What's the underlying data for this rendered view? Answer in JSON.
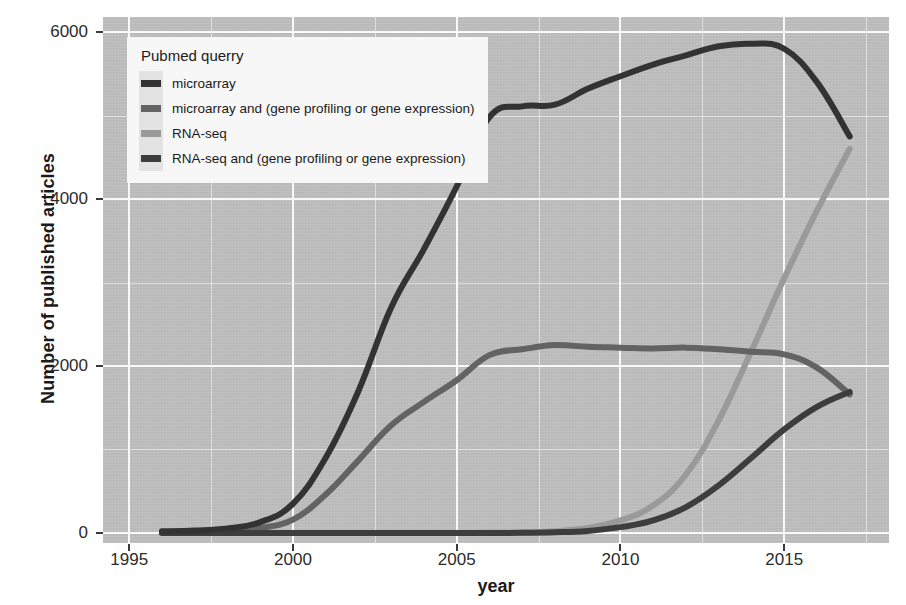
{
  "chart_data": {
    "type": "line",
    "title": "",
    "xlabel": "year",
    "ylabel": "Number of published articles",
    "xlim": [
      1994.2,
      2018.2
    ],
    "ylim": [
      -120,
      6180
    ],
    "grid": true,
    "legend_position": "top-left-inside",
    "legend_title": "Pubmed querry",
    "x_ticks": [
      1995,
      2000,
      2005,
      2010,
      2015
    ],
    "x_tick_labels": [
      "1995",
      "2000",
      "2005",
      "2010",
      "2015"
    ],
    "y_ticks": [
      0,
      2000,
      4000,
      6000
    ],
    "y_tick_labels": [
      "0",
      "2000",
      "4000",
      "6000"
    ],
    "x_minor_ticks": [
      1997.5,
      2002.5,
      2007.5,
      2012.5,
      2017.5
    ],
    "y_minor_ticks": [
      1000,
      3000,
      5000
    ],
    "x": [
      1996,
      1997,
      1998,
      1999,
      2000,
      2001,
      2002,
      2003,
      2004,
      2005,
      2006,
      2007,
      2008,
      2009,
      2010,
      2011,
      2012,
      2013,
      2014,
      2015,
      2016,
      2017
    ],
    "series": [
      {
        "name": "microarray",
        "color": "#333333",
        "values": [
          20,
          30,
          55,
          130,
          350,
          900,
          1700,
          2700,
          3400,
          4150,
          4980,
          5110,
          5130,
          5320,
          5470,
          5610,
          5720,
          5830,
          5860,
          5800,
          5400,
          4750
        ]
      },
      {
        "name": "microarray and (gene profiling or gene expression)",
        "color": "#636363",
        "values": [
          10,
          15,
          25,
          60,
          160,
          460,
          870,
          1290,
          1570,
          1830,
          2130,
          2200,
          2250,
          2230,
          2220,
          2210,
          2220,
          2200,
          2170,
          2140,
          1980,
          1660
        ]
      },
      {
        "name": "RNA-seq",
        "color": "#9a9a9a",
        "values": [
          0,
          0,
          0,
          0,
          0,
          0,
          0,
          0,
          0,
          0,
          2,
          5,
          20,
          60,
          150,
          330,
          700,
          1350,
          2180,
          3050,
          3860,
          4600
        ]
      },
      {
        "name": "RNA-seq and (gene profiling or gene expression)",
        "color": "#3d3d3d",
        "values": [
          0,
          0,
          0,
          0,
          0,
          0,
          0,
          0,
          0,
          0,
          0,
          2,
          8,
          25,
          70,
          150,
          310,
          570,
          900,
          1240,
          1510,
          1690
        ]
      }
    ]
  },
  "axes": {
    "y_title": "Number of published articles",
    "x_title": "year"
  },
  "legend": {
    "title": "Pubmed querry",
    "items": [
      {
        "label": "microarray",
        "color": "#333333"
      },
      {
        "label": "microarray and (gene profiling or gene expression)",
        "color": "#636363"
      },
      {
        "label": "RNA-seq",
        "color": "#9a9a9a"
      },
      {
        "label": "RNA-seq and (gene profiling or gene expression)",
        "color": "#3d3d3d"
      }
    ]
  },
  "style": {
    "panel_background": "#bfbfbf",
    "grid_color": "#ffffff",
    "legend_background": "#f7f7f7",
    "legend_key_background": "#e3e3e3",
    "text_color": "#1a1a1a"
  }
}
